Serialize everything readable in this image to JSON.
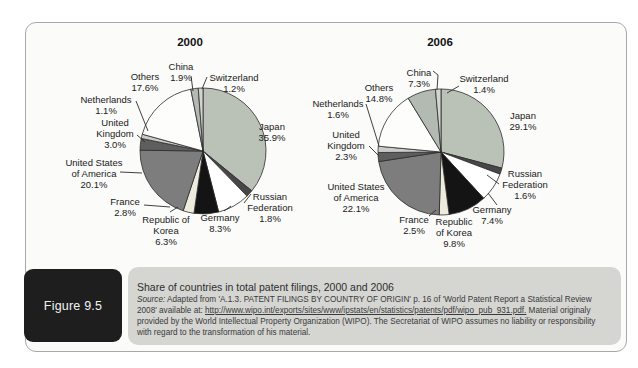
{
  "figure": {
    "id_label": "Figure 9.5",
    "title": "Share of countries in total patent filings, 2000 and 2006",
    "source_prefix": "Source:",
    "source_text": " Adapted from 'A.1.3. PATENT FILINGS BY COUNTRY OF ORIGIN' p. 16 of 'World Patent Report a Statistical Review 2008' available at: ",
    "source_url": "http://www.wipo.int/exports/sites/www/ipstats/en/statistics/patents/pdf/wipo_pub_931.pdf.",
    "source_suffix": " Material originaly provided by the World Intellectual Property Organization (WIPO). The Secretariat of WIPO assumes no liability or responsibility with regard to the transformation of his material."
  },
  "colors": {
    "panel_border": "#a9a9a7",
    "caption_box": "#d5d5d2",
    "figure_box": "#1e1e1e",
    "slice_stroke": "#2b2b2b"
  },
  "chart_data": [
    {
      "type": "pie",
      "title": "2000",
      "unit": "%",
      "start_angle_deg": 0,
      "direction": "clockwise",
      "legend_position": "around-slices",
      "slices": [
        {
          "label": "Japan",
          "value": 35.9,
          "pct_label": "35.9%",
          "lines": [
            "Japan",
            "35.9%"
          ],
          "color": "#bac2b8"
        },
        {
          "label": "Russian Federation",
          "value": 1.8,
          "pct_label": "1.8%",
          "lines": [
            "Russian",
            "Federation",
            "1.8%"
          ],
          "color": "#474747"
        },
        {
          "label": "Germany",
          "value": 8.3,
          "pct_label": "8.3%",
          "lines": [
            "Germany",
            "8.3%"
          ],
          "color": "#ffffff"
        },
        {
          "label": "Republic of Korea",
          "value": 6.3,
          "pct_label": "6.3%",
          "lines": [
            "Republic of",
            "Korea",
            "6.3%"
          ],
          "color": "#141414"
        },
        {
          "label": "France",
          "value": 2.8,
          "pct_label": "2.8%",
          "lines": [
            "France",
            "2.8%"
          ],
          "color": "#efecdd"
        },
        {
          "label": "United States of America",
          "value": 20.1,
          "pct_label": "20.1%",
          "lines": [
            "United States",
            "of America",
            "20.1%"
          ],
          "color": "#7d7d7d"
        },
        {
          "label": "United Kingdom",
          "value": 3.0,
          "pct_label": "3.0%",
          "lines": [
            "United",
            "Kingdom",
            "3.0%"
          ],
          "color": "#5e5e5e"
        },
        {
          "label": "Netherlands",
          "value": 1.1,
          "pct_label": "1.1%",
          "lines": [
            "Netherlands",
            "1.1%"
          ],
          "color": "#cbcbc7"
        },
        {
          "label": "Others",
          "value": 17.6,
          "pct_label": "17.6%",
          "lines": [
            "Others",
            "17.6%"
          ],
          "color": "#fdfdfb"
        },
        {
          "label": "China",
          "value": 1.9,
          "pct_label": "1.9%",
          "lines": [
            "China",
            "1.9%"
          ],
          "color": "#b3bab1"
        },
        {
          "label": "Switzerland",
          "value": 1.2,
          "pct_label": "1.2%",
          "lines": [
            "Switzerland",
            "1.2%"
          ],
          "color": "#d2d5cf"
        }
      ]
    },
    {
      "type": "pie",
      "title": "2006",
      "unit": "%",
      "start_angle_deg": 0,
      "direction": "clockwise",
      "legend_position": "around-slices",
      "slices": [
        {
          "label": "Japan",
          "value": 29.1,
          "pct_label": "29.1%",
          "lines": [
            "Japan",
            "29.1%"
          ],
          "color": "#bac2b8"
        },
        {
          "label": "Russian Federation",
          "value": 1.6,
          "pct_label": "1.6%",
          "lines": [
            "Russian",
            "Federation",
            "1.6%"
          ],
          "color": "#474747"
        },
        {
          "label": "Germany",
          "value": 7.4,
          "pct_label": "7.4%",
          "lines": [
            "Germany",
            "7.4%"
          ],
          "color": "#ffffff"
        },
        {
          "label": "Republic of Korea",
          "value": 9.8,
          "pct_label": "9.8%",
          "lines": [
            "Republic",
            "of Korea",
            "9.8%"
          ],
          "color": "#141414"
        },
        {
          "label": "France",
          "value": 2.5,
          "pct_label": "2.5%",
          "lines": [
            "France",
            "2.5%"
          ],
          "color": "#efecdd"
        },
        {
          "label": "United States of America",
          "value": 22.1,
          "pct_label": "22.1%",
          "lines": [
            "United States",
            "of America",
            "22.1%"
          ],
          "color": "#7d7d7d"
        },
        {
          "label": "United Kingdom",
          "value": 2.3,
          "pct_label": "2.3%",
          "lines": [
            "United",
            "Kingdom",
            "2.3%"
          ],
          "color": "#5e5e5e"
        },
        {
          "label": "Netherlands",
          "value": 1.6,
          "pct_label": "1.6%",
          "lines": [
            "Netherlands",
            "1.6%"
          ],
          "color": "#cbcbc7"
        },
        {
          "label": "Others",
          "value": 14.8,
          "pct_label": "14.8%",
          "lines": [
            "Others",
            "14.8%"
          ],
          "color": "#fdfdfb"
        },
        {
          "label": "China",
          "value": 7.3,
          "pct_label": "7.3%",
          "lines": [
            "China",
            "7.3%"
          ],
          "color": "#b3bab1"
        },
        {
          "label": "Switzerland",
          "value": 1.4,
          "pct_label": "1.4%",
          "lines": [
            "Switzerland",
            "1.4%"
          ],
          "color": "#d2d5cf"
        }
      ]
    }
  ]
}
